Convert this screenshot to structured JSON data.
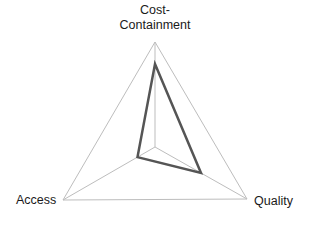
{
  "chart_data": {
    "type": "radar",
    "title": "",
    "axes": [
      "Cost-Containment",
      "Quality",
      "Access"
    ],
    "series": [
      {
        "name": "",
        "values": [
          0.79,
          0.5,
          0.19
        ]
      }
    ],
    "range": [
      0,
      1
    ],
    "grid": "outer triangle with spokes only",
    "legend": "none"
  },
  "labels": {
    "top_line1": "Cost-",
    "top_line2": "Containment",
    "left": "Access",
    "right": "Quality"
  },
  "colors": {
    "grid": "#bdbdbd",
    "series": "#555555"
  }
}
